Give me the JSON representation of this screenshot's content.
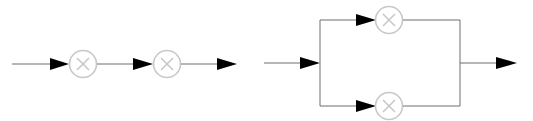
{
  "diagram": {
    "type": "signal-flow / block diagram",
    "colors": {
      "wire": "#6e6e6e",
      "arrowhead": "#000000",
      "multiplier_node": "#c8c8c8",
      "background": "#ffffff"
    },
    "panels": [
      {
        "name": "series-connection",
        "description": "Two multiplier nodes connected in series",
        "nodes": [
          {
            "id": "m1",
            "symbol": "multiply-icon",
            "glyph": "×"
          },
          {
            "id": "m2",
            "symbol": "multiply-icon",
            "glyph": "×"
          }
        ],
        "edges": [
          {
            "from": "input",
            "to": "m1"
          },
          {
            "from": "m1",
            "to": "m2"
          },
          {
            "from": "m2",
            "to": "output"
          }
        ]
      },
      {
        "name": "parallel-connection",
        "description": "Two multiplier nodes connected in parallel between a split and a join",
        "nodes": [
          {
            "id": "m_top",
            "symbol": "multiply-icon",
            "glyph": "×"
          },
          {
            "id": "m_bottom",
            "symbol": "multiply-icon",
            "glyph": "×"
          }
        ],
        "edges": [
          {
            "from": "input",
            "to": "split"
          },
          {
            "from": "split",
            "to": "m_top"
          },
          {
            "from": "split",
            "to": "m_bottom"
          },
          {
            "from": "m_top",
            "to": "join"
          },
          {
            "from": "m_bottom",
            "to": "join"
          },
          {
            "from": "join",
            "to": "output"
          }
        ]
      }
    ]
  }
}
